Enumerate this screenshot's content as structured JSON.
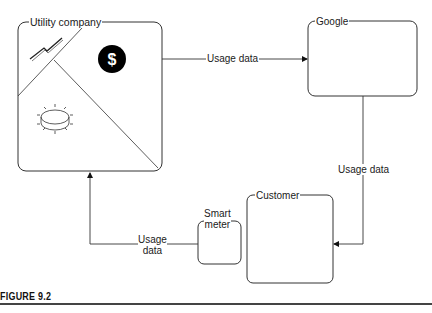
{
  "figure": {
    "caption": "FIGURE 9.2"
  },
  "nodes": {
    "utility_company": {
      "label": "Utility company",
      "icons": [
        "lightning-icon",
        "dollar-icon",
        "meter-dial-icon"
      ]
    },
    "google": {
      "label": "Google"
    },
    "customer": {
      "label": "Customer"
    },
    "smart_meter": {
      "label_line1": "Smart",
      "label_line2": "meter"
    }
  },
  "edges": {
    "utility_to_google": {
      "label": "Usage data"
    },
    "google_to_customer": {
      "label": "Usage data"
    },
    "meter_to_utility": {
      "label_line1": "Usage",
      "label_line2": "data"
    }
  },
  "colors": {
    "stroke": "#333333",
    "dollar_bg": "#000000",
    "dollar_fg": "#ffffff"
  }
}
